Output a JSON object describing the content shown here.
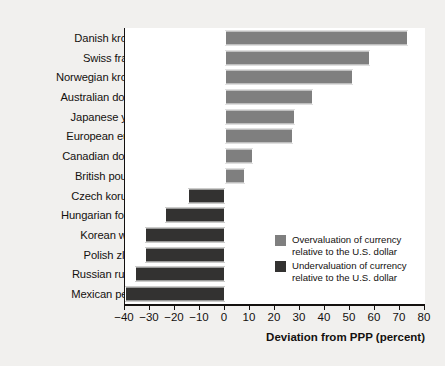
{
  "chart_data": {
    "type": "bar",
    "orientation": "horizontal",
    "title": "",
    "subtitle": "",
    "xlabel": "Deviation from PPP (percent)",
    "ylabel": "",
    "xlim": [
      -40,
      80
    ],
    "xticks": [
      -40,
      -30,
      -20,
      -10,
      0,
      10,
      20,
      30,
      40,
      50,
      60,
      70,
      80
    ],
    "xtick_labels": [
      "−40",
      "−30",
      "−20",
      "−10",
      "0",
      "10",
      "20",
      "30",
      "40",
      "50",
      "60",
      "70",
      "80"
    ],
    "grid": false,
    "legend_position": "inside-right",
    "categories": [
      "Danish krone",
      "Swiss franc",
      "Norwegian krone",
      "Australian dollar",
      "Japanese yen",
      "European euro",
      "Canadian dollar",
      "British pound",
      "Czech koruna",
      "Hungarian forint",
      "Korean won",
      "Polish zloty",
      "Russian ruble",
      "Mexican peso"
    ],
    "values": [
      73,
      58,
      51,
      35,
      28,
      27,
      11,
      8,
      -15,
      -24,
      -32,
      -32,
      -36,
      -40
    ],
    "series": [
      {
        "name": "Overvaluation of currency relative to the U.S. dollar",
        "color": "#7f7f7f"
      },
      {
        "name": "Undervaluation of currency relative to the U.S. dollar",
        "color": "#333231"
      }
    ],
    "legend": [
      {
        "swatch": "pos",
        "line1": "Overvaluation of currency",
        "line2": "relative to the U.S. dollar"
      },
      {
        "swatch": "neg",
        "line1": "Undervaluation of currency",
        "line2": "relative to the U.S. dollar"
      }
    ],
    "colors": {
      "positive_bar": "#7f7f7f",
      "negative_bar": "#333231",
      "axis": "#14110f",
      "plot_background": "#ffffff",
      "page_background": "#f1f0ee"
    }
  }
}
